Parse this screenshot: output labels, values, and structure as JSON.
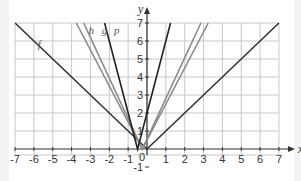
{
  "chart_data": {
    "type": "line",
    "title": "",
    "xlabel": "x",
    "ylabel": "y",
    "xlim": [
      -7,
      7
    ],
    "ylim": [
      -1,
      7
    ],
    "grid": true,
    "xticks": [
      "-7",
      "-6",
      "-5",
      "-4",
      "-3",
      "-2",
      "-1",
      "0",
      "1",
      "2",
      "3",
      "4",
      "5",
      "6",
      "7"
    ],
    "yticks": [
      "-1",
      "1",
      "2",
      "3",
      "4",
      "5",
      "6",
      "7"
    ],
    "origin_label": "0",
    "series": [
      {
        "name": "f",
        "formula": "|x|",
        "color": "#333333",
        "points": [
          [
            -7,
            7
          ],
          [
            0,
            0
          ],
          [
            7,
            7
          ]
        ]
      },
      {
        "name": "h",
        "formula": "approx 2|x+0.25|",
        "color": "#8a8a8a",
        "points": [
          [
            -3.75,
            7
          ],
          [
            -0.25,
            0
          ],
          [
            3.25,
            7
          ]
        ]
      },
      {
        "name": "g",
        "formula": "approx 2.25|x+0.25|",
        "color": "#8a8a8a",
        "points": [
          [
            -3.36,
            7
          ],
          [
            -0.25,
            0
          ],
          [
            2.86,
            7
          ]
        ]
      },
      {
        "name": "p",
        "formula": "approx 4|x+0.5|",
        "color": "#222222",
        "points": [
          [
            -2.25,
            7
          ],
          [
            -0.5,
            0
          ],
          [
            1.25,
            7
          ]
        ]
      }
    ],
    "legend": "inline labels near curves"
  }
}
